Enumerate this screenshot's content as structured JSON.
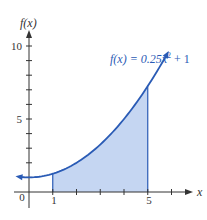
{
  "chart_data": {
    "type": "area",
    "title": "",
    "function_label": "f(x) = 0.25x² + 1",
    "function": {
      "a": 0.25,
      "b": 0,
      "c": 1
    },
    "shaded_interval": [
      1,
      5
    ],
    "xlabel": "x",
    "ylabel": "f(x)",
    "x_tick_labels": [
      "0",
      "1",
      "5"
    ],
    "y_tick_labels": [
      "5",
      "10"
    ],
    "x_ticks": [
      1,
      2,
      3,
      4,
      5,
      6
    ],
    "y_ticks": [
      1,
      2,
      3,
      4,
      5,
      6,
      7,
      8,
      9,
      10
    ],
    "curve_x_range": [
      -0.4,
      5.8
    ],
    "xlim": [
      -1,
      7.2
    ],
    "ylim": [
      -1.5,
      11.5
    ],
    "grid": false,
    "x": [
      1,
      2,
      3,
      4,
      5
    ],
    "y": [
      1.25,
      2,
      3.25,
      5,
      7.25
    ],
    "colors": {
      "curve": "#2a5bb5",
      "fill": "#c5d6f2",
      "axis": "#333333"
    }
  },
  "labels": {
    "origin": "0",
    "x1": "1",
    "x5": "5",
    "y5": "5",
    "y10": "10",
    "x_axis": "x",
    "y_axis": "f(x)",
    "equation_prefix": "f(x) = 0.25x",
    "equation_sup": "2",
    "equation_suffix": " + 1"
  }
}
